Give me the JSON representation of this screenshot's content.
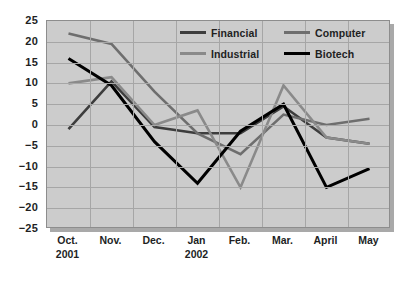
{
  "chart_data": {
    "type": "line",
    "title": "",
    "subtitle": "",
    "xlabel": "",
    "ylabel": "",
    "categories": [
      "Oct. 2001",
      "Nov.",
      "Dec.",
      "Jan 2002",
      "Feb.",
      "Mar.",
      "April",
      "May"
    ],
    "category_lines": [
      [
        "Oct.",
        "2001"
      ],
      [
        "Nov.",
        ""
      ],
      [
        "Dec.",
        ""
      ],
      [
        "Jan",
        "2002"
      ],
      [
        "Feb.",
        ""
      ],
      [
        "Mar.",
        ""
      ],
      [
        "April",
        ""
      ],
      [
        "May",
        ""
      ]
    ],
    "ylim": [
      -25,
      25
    ],
    "yticks": [
      25,
      20,
      15,
      10,
      5,
      0,
      -5,
      -10,
      -15,
      -20,
      -25
    ],
    "ytick_labels": [
      "25",
      "20",
      "15",
      "10",
      "5",
      "0",
      "−5",
      "−10",
      "−15",
      "−20",
      "−25"
    ],
    "grid": true,
    "legend_position": "top-right-inside",
    "series": [
      {
        "name": "Financial",
        "color": "#3d3d3d",
        "values": [
          -1,
          10.5,
          -0.5,
          -2,
          -2,
          4.5,
          -3,
          -4.5
        ]
      },
      {
        "name": "Computer",
        "color": "#6e6e6e",
        "values": [
          22,
          19.5,
          8,
          -2,
          -7,
          2.5,
          0,
          1.5
        ]
      },
      {
        "name": "Industrial",
        "color": "#8a8a8a",
        "values": [
          10,
          11.5,
          0,
          3.5,
          -15,
          9.5,
          -3,
          -4.5
        ]
      },
      {
        "name": "Biotech",
        "color": "#000000",
        "values": [
          16,
          9.5,
          -4,
          -14,
          -1.5,
          5,
          -15,
          -10.5
        ]
      }
    ]
  },
  "legend": {
    "entries": [
      {
        "label": "Financial",
        "swatch_color": "#3d3d3d"
      },
      {
        "label": "Computer",
        "swatch_color": "#6e6e6e"
      },
      {
        "label": "Industrial",
        "swatch_color": "#8a8a8a"
      },
      {
        "label": "Biotech",
        "swatch_color": "#000000"
      }
    ]
  },
  "axes": {
    "y_labels": [
      "25",
      "20",
      "15",
      "10",
      "5",
      "0",
      "−5",
      "−10",
      "−15",
      "−20",
      "−25"
    ],
    "x_labels_primary": [
      "Oct.",
      "Nov.",
      "Dec.",
      "Jan",
      "Feb.",
      "Mar.",
      "April",
      "May"
    ],
    "x_labels_secondary": [
      "2001",
      "",
      "",
      "2002",
      "",
      "",
      "",
      ""
    ]
  },
  "colors": {
    "plot_background": "#cccccc",
    "grid_line": "#a6a6a6",
    "plot_border": "#8d8d8d",
    "page_background": "#ffffff",
    "text": "#221f1f"
  }
}
